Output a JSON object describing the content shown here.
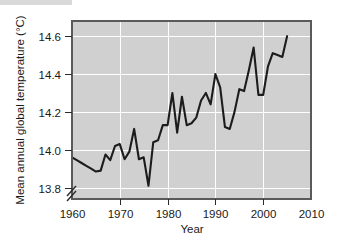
{
  "figure": {
    "background_color": "#ffffff",
    "top_band_color": "#d9d9d9",
    "plot_background_color": "#d0d0d0",
    "frame_color": "#5a5a5a",
    "gridline_color": "#ffffff",
    "line_color": "#1c1c1c",
    "text_color": "#1a1a1a"
  },
  "chart_data": {
    "type": "line",
    "title": "",
    "xlabel": "Year",
    "ylabel": "Mean annual global temperature (°C)",
    "xlim": [
      1960,
      2010
    ],
    "ylim": [
      13.74,
      14.68
    ],
    "xticks": [
      1960,
      1970,
      1980,
      1990,
      2000,
      2010
    ],
    "xtick_labels": [
      "1960",
      "1970",
      "1980",
      "1990",
      "2000",
      "2010"
    ],
    "yticks": [
      13.8,
      14.0,
      14.2,
      14.4,
      14.6
    ],
    "ytick_labels": [
      "13.8",
      "14.0",
      "14.2",
      "14.4",
      "14.6"
    ],
    "grid": true,
    "grid_color": "#ffffff",
    "axis_break": true,
    "axis_break_position": "below 13.8 on y-axis",
    "legend": null,
    "series": [
      {
        "name": "Mean annual global temperature",
        "color": "#1c1c1c",
        "x": [
          1960,
          1961,
          1962,
          1963,
          1964,
          1965,
          1966,
          1967,
          1968,
          1969,
          1970,
          1971,
          1972,
          1973,
          1974,
          1975,
          1976,
          1977,
          1978,
          1979,
          1980,
          1981,
          1982,
          1983,
          1984,
          1985,
          1986,
          1987,
          1988,
          1989,
          1990,
          1991,
          1992,
          1993,
          1994,
          1995,
          1996,
          1997,
          1998,
          1999,
          2000,
          2001,
          2002,
          2003,
          2004,
          2005
        ],
        "values": [
          13.96,
          13.945,
          13.93,
          13.915,
          13.9,
          13.885,
          13.89,
          13.975,
          13.945,
          14.02,
          14.03,
          13.95,
          13.99,
          14.11,
          13.95,
          13.96,
          13.81,
          14.04,
          14.05,
          14.13,
          14.13,
          14.3,
          14.09,
          14.28,
          14.13,
          14.14,
          14.17,
          14.26,
          14.3,
          14.24,
          14.4,
          14.33,
          14.12,
          14.11,
          14.2,
          14.32,
          14.31,
          14.42,
          14.54,
          14.29,
          14.29,
          14.44,
          14.51,
          14.5,
          14.49,
          14.6
        ]
      }
    ]
  }
}
